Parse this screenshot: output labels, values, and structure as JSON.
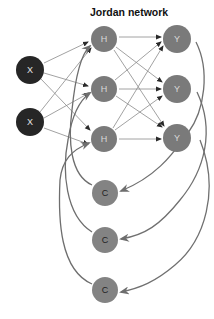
{
  "title": "Jordan network",
  "colors": {
    "input_fill": "#262626",
    "input_text": "#e6e6e6",
    "hidden_fill": "#7a7a7a",
    "hidden_text": "#d9d9d9",
    "output_fill": "#7a7a7a",
    "output_text": "#d9d9d9",
    "context_fill": "#838383",
    "context_text": "#1e1e1e",
    "thin_edge": "#8a8a8a",
    "thick_edge": "#707070"
  },
  "nodes": {
    "input": [
      {
        "label": "X",
        "cx": 30,
        "cy": 70,
        "r": 14
      },
      {
        "label": "X",
        "cx": 30,
        "cy": 122,
        "r": 14
      }
    ],
    "hidden": [
      {
        "label": "H",
        "cx": 104,
        "cy": 39,
        "r": 13
      },
      {
        "label": "H",
        "cx": 104,
        "cy": 89,
        "r": 13
      },
      {
        "label": "H",
        "cx": 104,
        "cy": 139,
        "r": 13
      }
    ],
    "output": [
      {
        "label": "Y",
        "cx": 177,
        "cy": 39,
        "r": 14
      },
      {
        "label": "Y",
        "cx": 177,
        "cy": 89,
        "r": 14
      },
      {
        "label": "Y",
        "cx": 177,
        "cy": 138,
        "r": 14
      }
    ],
    "context": [
      {
        "label": "C",
        "cx": 105,
        "cy": 193,
        "r": 13
      },
      {
        "label": "C",
        "cx": 105,
        "cy": 240,
        "r": 13
      },
      {
        "label": "C",
        "cx": 105,
        "cy": 290,
        "r": 13
      }
    ]
  },
  "edges": {
    "input_to_hidden": "fully connected",
    "hidden_to_output": "fully connected",
    "output_to_context": "one-to-one recurrent",
    "context_to_hidden": "one-to-one recurrent"
  }
}
